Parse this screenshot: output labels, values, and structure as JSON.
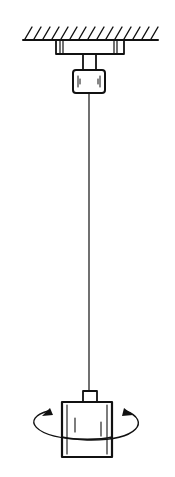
{
  "diagram": {
    "components": [
      {
        "id": "ceiling",
        "label": "fixed support (hatched ceiling)"
      },
      {
        "id": "bracket",
        "label": "mounting bracket"
      },
      {
        "id": "clamp",
        "label": "upper wire clamp"
      },
      {
        "id": "wire",
        "label": "suspension wire"
      },
      {
        "id": "bob",
        "label": "cylindrical bob"
      },
      {
        "id": "rotation",
        "label": "rotational oscillation arrow"
      }
    ],
    "colors": {
      "ink": "#111111",
      "background": "#ffffff"
    }
  }
}
